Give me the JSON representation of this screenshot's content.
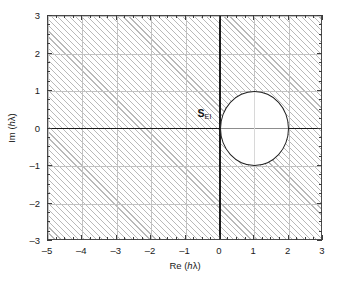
{
  "figure": {
    "title": "",
    "region_label": {
      "symbol": "S",
      "subscript": "EI"
    }
  },
  "axes": {
    "x": {
      "title_prefix": "Re (",
      "title_var": "h",
      "title_suffix": "λ)",
      "min": -5,
      "max": 3,
      "major_step": 1,
      "minor_step": 0.25,
      "ticks": [
        "-5",
        "-4",
        "-3",
        "-2",
        "-1",
        "0",
        "1",
        "2",
        "3"
      ]
    },
    "y": {
      "title_prefix": "Im (",
      "title_var": "h",
      "title_suffix": "λ)",
      "min": -3,
      "max": 3,
      "major_step": 1,
      "minor_step": 0.25,
      "ticks": [
        "3",
        "2",
        "1",
        "0",
        "-1",
        "-2",
        "-3"
      ]
    }
  },
  "colors": {
    "hatch": "#b9b9b9",
    "grid": "#c2c2c2",
    "axis": "#1a1a1a",
    "frame": "#4a4a4a",
    "curve": "#1f1f1f",
    "background": "#ffffff"
  },
  "chart_data": {
    "type": "line",
    "title": "",
    "xlabel": "Re (hλ)",
    "ylabel": "Im (hλ)",
    "xlim": [
      -5,
      3
    ],
    "ylim": [
      -3,
      3
    ],
    "xticks": [
      -5,
      -4,
      -3,
      -2,
      -1,
      0,
      1,
      2,
      3
    ],
    "yticks": [
      -3,
      -2,
      -1,
      0,
      1,
      2,
      3
    ],
    "grid": true,
    "legend": "none",
    "annotations": [
      {
        "text": "S_EI",
        "x": -0.65,
        "y": 0.55,
        "display": "S",
        "subscript": "EI"
      }
    ],
    "series": [
      {
        "name": "stability boundary (unit circle centered at 1)",
        "type": "circle",
        "center": [
          1,
          0
        ],
        "radius": 1,
        "closed": true,
        "color": "#1f1f1f"
      }
    ],
    "shaded_region": {
      "name": "stability region S_EI",
      "description": "entire complex plane hatched except interior of circle |hλ - 1| < 1",
      "fill": "hatch-diagonal",
      "excluded": {
        "center": [
          1,
          0
        ],
        "radius": 1
      }
    }
  }
}
